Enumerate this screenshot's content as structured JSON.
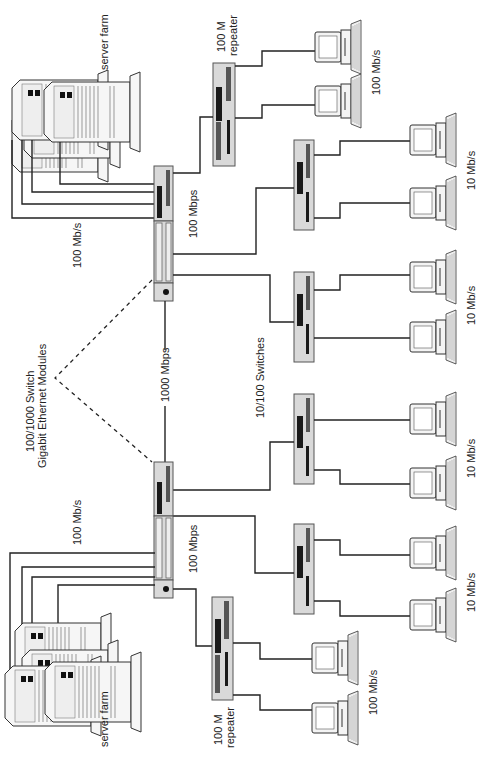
{
  "diagram": {
    "orientation": "rotated 90 degrees counter-clockwise",
    "labels": {
      "server_farm_top": "server farm",
      "server_farm_bottom": "server farm",
      "repeater_top_line1": "100 M",
      "repeater_top_line2": "repeater",
      "repeater_bottom_line1": "100 M",
      "repeater_bottom_line2": "repeater",
      "link_servers_top": "100 Mb/s",
      "link_servers_bottom": "100 Mb/s",
      "core_top_speed": "100 Mbps",
      "core_bottom_speed": "100 Mbps",
      "backbone_speed": "1000 Mbps",
      "core_caption_line1": "100/1000 Switch",
      "core_caption_line2": "Gigabit Ethernet Modules",
      "access_caption": "10/100 Switches",
      "pc_rate_100_top": "100 Mb/s",
      "pc_rate_100_bottom": "100 Mb/s",
      "pc_rate_10_a": "10 Mb/s",
      "pc_rate_10_b": "10 Mb/s",
      "pc_rate_10_c": "10 Mb/s",
      "pc_rate_10_d": "10 Mb/s"
    },
    "nodes": [
      {
        "id": "core-switch-top",
        "type": "100/1000 switch"
      },
      {
        "id": "core-switch-bottom",
        "type": "100/1000 switch"
      },
      {
        "id": "repeater-top",
        "type": "100 M repeater"
      },
      {
        "id": "repeater-bottom",
        "type": "100 M repeater"
      },
      {
        "id": "access-switch-1",
        "type": "10/100 switch"
      },
      {
        "id": "access-switch-2",
        "type": "10/100 switch"
      },
      {
        "id": "access-switch-3",
        "type": "10/100 switch"
      },
      {
        "id": "access-switch-4",
        "type": "10/100 switch"
      },
      {
        "id": "server-farm-top",
        "type": "server farm",
        "servers": 4
      },
      {
        "id": "server-farm-bottom",
        "type": "server farm",
        "servers": 4
      }
    ],
    "workstations": 12,
    "colors": {
      "device_fill": "#d9d9d9",
      "line": "#222222",
      "background": "#ffffff"
    }
  }
}
